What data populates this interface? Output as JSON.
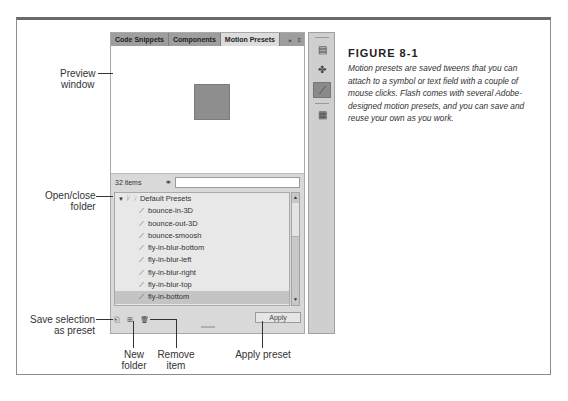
{
  "figure": {
    "title": "FIGURE 8-1",
    "caption": "Motion presets are saved tweens that you can attach to a symbol or text field with a couple of mouse clicks. Flash comes with several Adobe-designed motion presets, and you can save and reuse your own as you work."
  },
  "panel": {
    "tabs": [
      {
        "label": "Code Snippets",
        "active": false
      },
      {
        "label": "Components",
        "active": false
      },
      {
        "label": "Motion Presets",
        "active": true
      }
    ],
    "tab_controls": {
      "expand": "»",
      "menu": "≡"
    },
    "item_count": "32 items",
    "search": {
      "value": "",
      "placeholder": ""
    },
    "tree": {
      "folder": {
        "label": "Default Presets",
        "expanded": true
      },
      "items": [
        {
          "label": "bounce-in-3D",
          "selected": false
        },
        {
          "label": "bounce-out-3D",
          "selected": false
        },
        {
          "label": "bounce-smoosh",
          "selected": false
        },
        {
          "label": "fly-in-blur-bottom",
          "selected": false
        },
        {
          "label": "fly-in-blur-left",
          "selected": false
        },
        {
          "label": "fly-in-blur-right",
          "selected": false
        },
        {
          "label": "fly-in-blur-top",
          "selected": false
        },
        {
          "label": "fly-in-bottom",
          "selected": true
        },
        {
          "label": "fly-in-left",
          "selected": false
        }
      ]
    },
    "apply_label": "Apply"
  },
  "dock": {
    "icons": [
      "code-snippets-icon",
      "components-icon",
      "motion-presets-icon",
      "library-icon"
    ]
  },
  "callouts": {
    "preview": [
      "Preview",
      "window"
    ],
    "open_close": [
      "Open/close",
      "folder"
    ],
    "save_selection": [
      "Save selection",
      "as preset"
    ],
    "new_folder": [
      "New",
      "folder"
    ],
    "remove_item": [
      "Remove",
      "item"
    ],
    "apply_preset": "Apply preset"
  }
}
